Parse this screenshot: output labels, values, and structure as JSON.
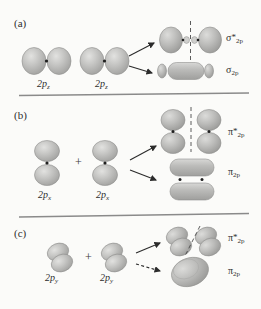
{
  "figure": {
    "caption_panels": [
      "(a)",
      "(b)",
      "(c)"
    ],
    "background_color": "#fbfbf9",
    "orbital_fill": "#b9b9b9",
    "orbital_stroke": "#8e8e8e",
    "line_color": "#8a8a8a",
    "text_color": "#2e2e2e"
  },
  "panels": [
    {
      "tag": "(a)",
      "atomic_orbitals": [
        {
          "label_prefix": "2p",
          "label_sub": "z",
          "type": "p-sigma-horizontal"
        },
        {
          "label_prefix": "2p",
          "label_sub": "z",
          "type": "p-sigma-horizontal"
        }
      ],
      "plus_sign": "",
      "products": [
        {
          "name_greek": "σ",
          "star": "*",
          "sub": "2p",
          "kind": "antibonding",
          "nodal_plane": "vertical-dashed"
        },
        {
          "name_greek": "σ",
          "star": "",
          "sub": "2p",
          "kind": "bonding",
          "nodal_plane": "none"
        }
      ],
      "arrows": [
        "solid",
        "solid"
      ]
    },
    {
      "tag": "(b)",
      "atomic_orbitals": [
        {
          "label_prefix": "2p",
          "label_sub": "x",
          "type": "p-pi-vertical"
        },
        {
          "label_prefix": "2p",
          "label_sub": "x",
          "type": "p-pi-vertical"
        }
      ],
      "plus_sign": "+",
      "products": [
        {
          "name_greek": "π",
          "star": "*",
          "sub": "2p",
          "kind": "antibonding",
          "nodal_plane": "vertical-dashed"
        },
        {
          "name_greek": "π",
          "star": "",
          "sub": "2p",
          "kind": "bonding",
          "nodal_plane": "none"
        }
      ],
      "arrows": [
        "solid",
        "solid"
      ]
    },
    {
      "tag": "(c)",
      "atomic_orbitals": [
        {
          "label_prefix": "2p",
          "label_sub": "y",
          "type": "p-pi-perspective"
        },
        {
          "label_prefix": "2p",
          "label_sub": "y",
          "type": "p-pi-perspective"
        }
      ],
      "plus_sign": "+",
      "products": [
        {
          "name_greek": "π",
          "star": "*",
          "sub": "2p",
          "kind": "antibonding",
          "nodal_plane": "diagonal-dashed"
        },
        {
          "name_greek": "π",
          "star": "",
          "sub": "2p",
          "kind": "bonding",
          "nodal_plane": "none"
        }
      ],
      "arrows": [
        "solid",
        "dashed"
      ]
    }
  ],
  "labels": {
    "panel_a_tag": "(a)",
    "panel_b_tag": "(b)",
    "panel_c_tag": "(c)",
    "a_orb1_main": "2p",
    "a_orb1_sub": "z",
    "a_orb2_main": "2p",
    "a_orb2_sub": "z",
    "a_anti_greek": "σ",
    "a_anti_star": "*",
    "a_anti_sub": "2p",
    "a_bond_greek": "σ",
    "a_bond_sub": "2p",
    "b_plus": "+",
    "b_orb1_main": "2p",
    "b_orb1_sub": "x",
    "b_orb2_main": "2p",
    "b_orb2_sub": "x",
    "b_anti_greek": "π",
    "b_anti_star": "*",
    "b_anti_sub": "2p",
    "b_bond_greek": "π",
    "b_bond_sub": "2p",
    "c_plus": "+",
    "c_orb1_main": "2p",
    "c_orb1_sub": "y",
    "c_orb2_main": "2p",
    "c_orb2_sub": "y",
    "c_anti_greek": "π",
    "c_anti_star": "*",
    "c_anti_sub": "2p",
    "c_bond_greek": "π",
    "c_bond_sub": "2p"
  }
}
